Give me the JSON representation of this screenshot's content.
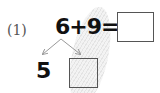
{
  "problem": {
    "number_label": "(1)",
    "equation": "6+9=",
    "answer_box": "",
    "decomposition": {
      "known_part": "5",
      "unknown_box": ""
    }
  },
  "colors": {
    "text": "#111111",
    "arrow": "#999999",
    "box_border": "#555555"
  }
}
